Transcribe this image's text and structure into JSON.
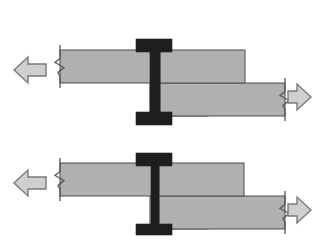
{
  "figure": {
    "title": "Beam-to-column moment connection deformation diagram",
    "background_color": "#ffffff",
    "width": 315,
    "height": 245,
    "colors": {
      "beam_fill": "#b0b0b0",
      "beam_stroke": "#4d4d4d",
      "column_fill": "#1e1e1e",
      "arrow_fill": "#cfcfcf",
      "arrow_stroke": "#7a7a7a",
      "break_line": "#555555"
    },
    "panels": [
      {
        "name": "upper-panel",
        "label": "",
        "column": {
          "name": "upper-column",
          "shape": "i-section",
          "flange_left_x": 136,
          "flange_right_x": 172,
          "top_y": 39,
          "bottom_y": 125,
          "web_left_x": 150,
          "web_right_x": 160,
          "top_flange_bottom_y": 52,
          "bottom_flange_top_y": 112
        },
        "beams": [
          {
            "name": "upper-left-beam",
            "x": 60,
            "y": 50,
            "width": 100,
            "height": 33,
            "side": "left",
            "level": "upper"
          },
          {
            "name": "upper-right-beam-top",
            "x": 160,
            "y": 50,
            "width": 85,
            "height": 33,
            "side": "right",
            "level": "upper"
          },
          {
            "name": "upper-left-beam-lower",
            "x": 150,
            "y": 83,
            "width": 58,
            "height": 33,
            "side": "center",
            "level": "lower"
          },
          {
            "name": "upper-right-beam-lower",
            "x": 160,
            "y": 83,
            "width": 125,
            "height": 33,
            "side": "right",
            "level": "lower"
          }
        ],
        "break_marks": [
          {
            "name": "upper-left-break",
            "x": 60,
            "y_top": 45,
            "y_bottom": 88
          },
          {
            "name": "upper-right-break",
            "x": 285,
            "y_top": 78,
            "y_bottom": 121
          }
        ],
        "arrows": [
          {
            "name": "upper-left-arrow",
            "direction": "left",
            "tip_x": 14,
            "tail_x": 46,
            "center_y": 70
          },
          {
            "name": "upper-right-arrow",
            "direction": "right",
            "tip_x": 311,
            "tail_x": 288,
            "center_y": 97
          }
        ]
      },
      {
        "name": "lower-panel",
        "label": "",
        "column": {
          "name": "lower-column",
          "shape": "i-section",
          "flange_left_x": 136,
          "flange_right_x": 172,
          "top_y": 153,
          "bottom_y": 235,
          "web_left_x": 151,
          "web_right_x": 159,
          "top_flange_bottom_y": 166,
          "bottom_flange_top_y": 224
        },
        "beams": [
          {
            "name": "lower-left-beam",
            "x": 60,
            "y": 163,
            "width": 100,
            "height": 33,
            "side": "left",
            "level": "upper"
          },
          {
            "name": "lower-right-beam-top",
            "x": 159,
            "y": 163,
            "width": 85,
            "height": 33,
            "side": "right",
            "level": "upper"
          },
          {
            "name": "lower-left-beam-lower",
            "x": 150,
            "y": 196,
            "width": 58,
            "height": 33,
            "side": "center",
            "level": "lower"
          },
          {
            "name": "lower-right-beam-lower",
            "x": 159,
            "y": 196,
            "width": 126,
            "height": 33,
            "side": "right",
            "level": "lower"
          }
        ],
        "break_marks": [
          {
            "name": "lower-left-break",
            "x": 60,
            "y_top": 158,
            "y_bottom": 201
          },
          {
            "name": "lower-right-break",
            "x": 285,
            "y_top": 191,
            "y_bottom": 234
          }
        ],
        "arrows": [
          {
            "name": "lower-left-arrow",
            "direction": "left",
            "tip_x": 14,
            "tail_x": 46,
            "center_y": 183
          },
          {
            "name": "lower-right-arrow",
            "direction": "right",
            "tip_x": 311,
            "tail_x": 288,
            "center_y": 210
          }
        ]
      }
    ]
  }
}
